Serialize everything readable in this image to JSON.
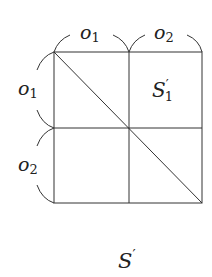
{
  "diagram": {
    "labels": {
      "top_left": "o",
      "top_left_sub": "1",
      "top_right": "o",
      "top_right_sub": "2",
      "left_top": "o",
      "left_top_sub": "1",
      "left_bottom": "o",
      "left_bottom_sub": "2",
      "cell": "S",
      "cell_prime": "′",
      "cell_sub": "1"
    },
    "caption": "S",
    "caption_prime": "′",
    "grid": {
      "rows": 2,
      "cols": 2,
      "diagonal": "top-left to bottom-right"
    },
    "stroke_color": "#333333"
  }
}
